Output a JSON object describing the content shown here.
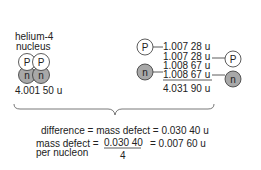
{
  "left": {
    "title_line1": "helium-4",
    "title_line2": "nucleus",
    "nucleus": {
      "particles": [
        {
          "type": "proton",
          "label": "P"
        },
        {
          "type": "proton",
          "label": "P"
        },
        {
          "type": "neutron",
          "label": "n"
        },
        {
          "type": "neutron",
          "label": "n"
        }
      ]
    },
    "mass": "4.001 50 u"
  },
  "right": {
    "particles": [
      {
        "type": "proton",
        "label": "P",
        "mass": "1.007 28 u"
      },
      {
        "type": "proton",
        "label": "P",
        "mass": "1.007 28 u"
      },
      {
        "type": "neutron",
        "label": "n",
        "mass": "1.008 67 u"
      },
      {
        "type": "neutron",
        "label": "n",
        "mass": "1.008 67 u"
      }
    ],
    "total": "4.031 90 u"
  },
  "difference": {
    "text": "difference = mass defect = 0.030 40 u"
  },
  "per_nucleon": {
    "label_line1": "mass defect =",
    "label_line2": "per nucleon",
    "numerator": "0.030 40",
    "denominator": "4",
    "result": "= 0.007 60 u"
  },
  "colors": {
    "proton_fill": "#ffffff",
    "neutron_fill": "#a8a8a8",
    "stroke": "#333333",
    "text": "#222222"
  }
}
